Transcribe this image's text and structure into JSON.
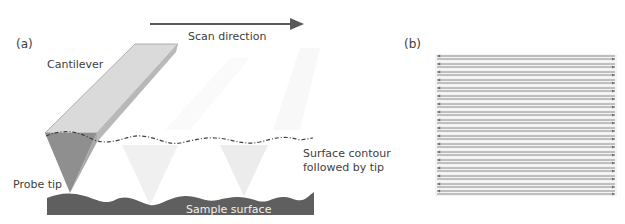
{
  "panel_a": {
    "label": "(a)",
    "scan_direction": "Scan direction",
    "cantilever": "Cantilever",
    "surface_contour_line1": "Surface contour",
    "surface_contour_line2": "followed by tip",
    "probe_tip": "Probe tip",
    "sample_surface": "Sample surface",
    "colors": {
      "cantilever_top": "#dcdcdc",
      "cantilever_side": "#a6a6a6",
      "tip_dark": "#8c8c8c",
      "sample": "#5f5f5f",
      "arrow": "#595959"
    }
  },
  "panel_b": {
    "label": "(b)",
    "raster_line_count": 18,
    "description": "Raster scan pattern: trace lines (→) and retrace lines (←)"
  }
}
